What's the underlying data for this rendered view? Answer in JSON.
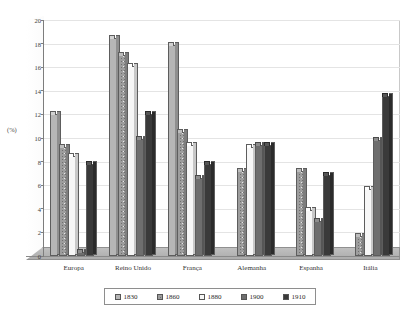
{
  "chart_data": {
    "type": "bar",
    "title": "",
    "xlabel": "",
    "ylabel": "(%)",
    "ylim": [
      0,
      20
    ],
    "ytick_step": 2,
    "yticks": [
      "0",
      "2",
      "4",
      "6",
      "8",
      "10",
      "12",
      "14",
      "16",
      "18",
      "20"
    ],
    "grid": true,
    "legend_position": "bottom",
    "categories": [
      "Europa",
      "Reino Unido",
      "França",
      "Alemanha",
      "Espanha",
      "Itália"
    ],
    "series": [
      {
        "name": "1830",
        "color": "#b6b6b6",
        "pattern": "light-solid",
        "values": [
          12.0,
          18.5,
          17.9,
          0.0,
          0.0,
          0.0
        ]
      },
      {
        "name": "1860",
        "color": "#9d9d9d",
        "pattern": "speckled",
        "values": [
          9.2,
          17.0,
          10.5,
          7.2,
          7.2,
          1.7
        ]
      },
      {
        "name": "1880",
        "color": "#f7f7f7",
        "pattern": "white-solid",
        "values": [
          8.5,
          16.1,
          9.4,
          9.2,
          3.9,
          5.7
        ]
      },
      {
        "name": "1900",
        "color": "#6e6e6e",
        "pattern": "dark-gray-solid",
        "values": [
          0.3,
          9.9,
          6.6,
          9.4,
          3.0,
          9.8
        ]
      },
      {
        "name": "1910",
        "color": "#3a3a3a",
        "pattern": "black-solid",
        "values": [
          7.8,
          12.0,
          7.8,
          9.4,
          6.9,
          13.6
        ]
      }
    ]
  },
  "legend": {
    "items": [
      {
        "label": "1830"
      },
      {
        "label": "1860"
      },
      {
        "label": "1880"
      },
      {
        "label": "1900"
      },
      {
        "label": "1910"
      }
    ]
  }
}
